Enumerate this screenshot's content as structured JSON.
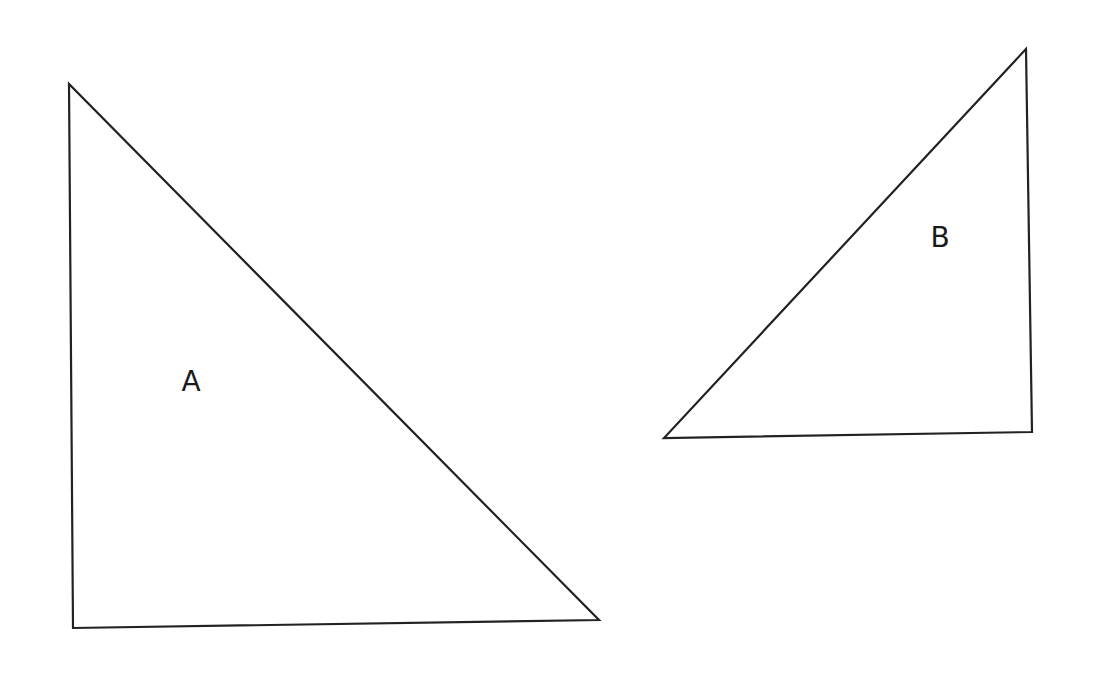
{
  "diagram": {
    "background": "#ffffff",
    "stroke_color": "#222222",
    "shapes": [
      {
        "type": "right-triangle",
        "label": "A",
        "vertices": [
          [
            69,
            84
          ],
          [
            73,
            628
          ],
          [
            599,
            620
          ]
        ],
        "label_position": [
          191,
          382
        ]
      },
      {
        "type": "right-triangle",
        "label": "B",
        "vertices": [
          [
            1026,
            49
          ],
          [
            664,
            438
          ],
          [
            1032,
            432
          ]
        ],
        "label_position": [
          940,
          238
        ]
      }
    ]
  }
}
